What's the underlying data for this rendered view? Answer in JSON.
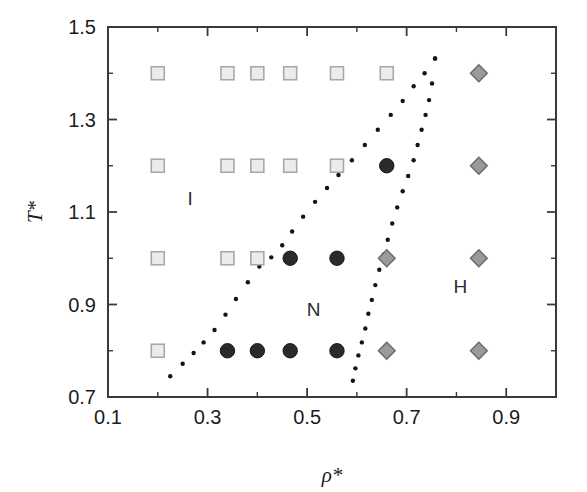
{
  "figure": {
    "background_color": "#ffffff",
    "frame_color": "#3a3a3a"
  },
  "chart_data": {
    "type": "scatter",
    "title": "",
    "subtitle": "",
    "xlabel": "ρ*",
    "ylabel": "T*",
    "xlim": [
      0.1,
      1.0
    ],
    "ylim": [
      0.7,
      1.5
    ],
    "grid": false,
    "legend_position": "none",
    "x_ticks_major": [
      0.1,
      0.3,
      0.5,
      0.7,
      0.9
    ],
    "x_ticklabels": [
      "0.1",
      "0.3",
      "0.5",
      "0.7",
      "0.9"
    ],
    "x_ticks_minor": [
      0.2,
      0.4,
      0.6,
      0.8,
      1.0
    ],
    "y_ticks_major": [
      0.7,
      0.9,
      1.1,
      1.3,
      1.5
    ],
    "y_ticklabels": [
      "0.7",
      "0.9",
      "1.1",
      "1.3",
      "1.5"
    ],
    "y_ticks_minor": [
      0.8,
      1.0,
      1.2,
      1.4
    ],
    "annotations": [
      {
        "text": "I",
        "x": 0.265,
        "y": 1.115,
        "name": "isotropic-phase-label"
      },
      {
        "text": "N",
        "x": 0.513,
        "y": 0.875,
        "name": "nematic-phase-label"
      },
      {
        "text": "H",
        "x": 0.808,
        "y": 0.925,
        "name": "hexagonal-phase-label"
      }
    ],
    "series": [
      {
        "name": "Isotropic (open square)",
        "marker": "square",
        "marker_fill": "#ececed",
        "marker_edge": "#a9a9ac",
        "points": [
          {
            "x": 0.2,
            "y": 1.4
          },
          {
            "x": 0.34,
            "y": 1.4
          },
          {
            "x": 0.4,
            "y": 1.4
          },
          {
            "x": 0.466,
            "y": 1.4
          },
          {
            "x": 0.56,
            "y": 1.4
          },
          {
            "x": 0.66,
            "y": 1.4
          },
          {
            "x": 0.2,
            "y": 1.2
          },
          {
            "x": 0.34,
            "y": 1.2
          },
          {
            "x": 0.4,
            "y": 1.2
          },
          {
            "x": 0.466,
            "y": 1.2
          },
          {
            "x": 0.56,
            "y": 1.2
          },
          {
            "x": 0.2,
            "y": 1.0
          },
          {
            "x": 0.34,
            "y": 1.0
          },
          {
            "x": 0.4,
            "y": 1.0
          },
          {
            "x": 0.2,
            "y": 0.8
          }
        ]
      },
      {
        "name": "Nematic (filled circle)",
        "marker": "circle",
        "marker_fill": "#2a2a2a",
        "marker_edge": "#161616",
        "points": [
          {
            "x": 0.66,
            "y": 1.2
          },
          {
            "x": 0.466,
            "y": 1.0
          },
          {
            "x": 0.56,
            "y": 1.0
          },
          {
            "x": 0.34,
            "y": 0.8
          },
          {
            "x": 0.4,
            "y": 0.8
          },
          {
            "x": 0.466,
            "y": 0.8
          },
          {
            "x": 0.56,
            "y": 0.8
          }
        ]
      },
      {
        "name": "Hexagonal (gray diamond)",
        "marker": "diamond",
        "marker_fill": "#9a9a9c",
        "marker_edge": "#69696c",
        "points": [
          {
            "x": 0.845,
            "y": 1.4
          },
          {
            "x": 0.845,
            "y": 1.2
          },
          {
            "x": 0.66,
            "y": 1.0
          },
          {
            "x": 0.845,
            "y": 1.0
          },
          {
            "x": 0.66,
            "y": 0.8
          },
          {
            "x": 0.845,
            "y": 0.8
          }
        ]
      }
    ],
    "boundaries": [
      {
        "name": "I-N phase boundary (dotted)",
        "style": "dotted",
        "color": "#141414",
        "points": [
          {
            "x": 0.225,
            "y": 0.745
          },
          {
            "x": 0.25,
            "y": 0.772
          },
          {
            "x": 0.272,
            "y": 0.795
          },
          {
            "x": 0.292,
            "y": 0.818
          },
          {
            "x": 0.314,
            "y": 0.845
          },
          {
            "x": 0.336,
            "y": 0.878
          },
          {
            "x": 0.357,
            "y": 0.912
          },
          {
            "x": 0.381,
            "y": 0.948
          },
          {
            "x": 0.404,
            "y": 0.982
          },
          {
            "x": 0.428,
            "y": 1.002
          },
          {
            "x": 0.45,
            "y": 1.028
          },
          {
            "x": 0.47,
            "y": 1.058
          },
          {
            "x": 0.492,
            "y": 1.09
          },
          {
            "x": 0.516,
            "y": 1.122
          },
          {
            "x": 0.54,
            "y": 1.152
          },
          {
            "x": 0.563,
            "y": 1.18
          },
          {
            "x": 0.59,
            "y": 1.212
          },
          {
            "x": 0.616,
            "y": 1.245
          },
          {
            "x": 0.642,
            "y": 1.278
          },
          {
            "x": 0.668,
            "y": 1.31
          },
          {
            "x": 0.692,
            "y": 1.34
          },
          {
            "x": 0.714,
            "y": 1.372
          },
          {
            "x": 0.736,
            "y": 1.4
          },
          {
            "x": 0.757,
            "y": 1.432
          }
        ]
      },
      {
        "name": "N-H phase boundary (dotted)",
        "style": "dotted",
        "color": "#141414",
        "points": [
          {
            "x": 0.592,
            "y": 0.735
          },
          {
            "x": 0.597,
            "y": 0.762
          },
          {
            "x": 0.603,
            "y": 0.79
          },
          {
            "x": 0.61,
            "y": 0.818
          },
          {
            "x": 0.617,
            "y": 0.848
          },
          {
            "x": 0.623,
            "y": 0.88
          },
          {
            "x": 0.63,
            "y": 0.91
          },
          {
            "x": 0.637,
            "y": 0.942
          },
          {
            "x": 0.645,
            "y": 0.975
          },
          {
            "x": 0.654,
            "y": 1.008
          },
          {
            "x": 0.662,
            "y": 1.04
          },
          {
            "x": 0.671,
            "y": 1.075
          },
          {
            "x": 0.681,
            "y": 1.11
          },
          {
            "x": 0.692,
            "y": 1.145
          },
          {
            "x": 0.703,
            "y": 1.178
          },
          {
            "x": 0.714,
            "y": 1.212
          },
          {
            "x": 0.722,
            "y": 1.245
          },
          {
            "x": 0.73,
            "y": 1.278
          },
          {
            "x": 0.738,
            "y": 1.31
          },
          {
            "x": 0.745,
            "y": 1.342
          },
          {
            "x": 0.751,
            "y": 1.378
          },
          {
            "x": 0.757,
            "y": 1.432
          }
        ]
      }
    ]
  }
}
